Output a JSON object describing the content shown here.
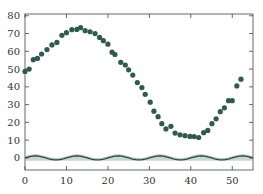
{
  "chart_data": {
    "type": "scatter",
    "title": "",
    "xlabel": "",
    "ylabel": "",
    "xlim": [
      0,
      55
    ],
    "ylim": [
      -6.8,
      81
    ],
    "grid": false,
    "legend": null,
    "x_ticks": [
      0,
      10,
      20,
      30,
      40,
      50
    ],
    "y_ticks": [
      0,
      10,
      20,
      30,
      40,
      50,
      60,
      70,
      80
    ],
    "series": [
      {
        "name": "observations",
        "type": "scatter",
        "color": "#2f5a4e",
        "points": [
          [
            0,
            48.7
          ],
          [
            1,
            50
          ],
          [
            2,
            55.3
          ],
          [
            3,
            56
          ],
          [
            4,
            58.5
          ],
          [
            5.3,
            61
          ],
          [
            6.5,
            63.6
          ],
          [
            7.7,
            65
          ],
          [
            8.9,
            69
          ],
          [
            10,
            70.5
          ],
          [
            11.3,
            72.2
          ],
          [
            12.5,
            72.3
          ],
          [
            13.4,
            73.3
          ],
          [
            14.5,
            71.6
          ],
          [
            15.7,
            71
          ],
          [
            16.9,
            70
          ],
          [
            18,
            67.8
          ],
          [
            18.9,
            66
          ],
          [
            20,
            64
          ],
          [
            21,
            59.5
          ],
          [
            21.7,
            58.2
          ],
          [
            23.1,
            53.8
          ],
          [
            24.2,
            52.3
          ],
          [
            25,
            49.6
          ],
          [
            26,
            46.6
          ],
          [
            27.1,
            42.4
          ],
          [
            28.2,
            39.6
          ],
          [
            29,
            35.8
          ],
          [
            30.2,
            31.4
          ],
          [
            31.1,
            26.3
          ],
          [
            32.1,
            23.2
          ],
          [
            33,
            19.3
          ],
          [
            34,
            16.3
          ],
          [
            35.2,
            17.8
          ],
          [
            36.2,
            14
          ],
          [
            37.4,
            13
          ],
          [
            38.6,
            12.5
          ],
          [
            39.8,
            12.1
          ],
          [
            40.8,
            12
          ],
          [
            41.9,
            11.5
          ],
          [
            43.1,
            14.2
          ],
          [
            44.1,
            15.5
          ],
          [
            45.1,
            19.3
          ],
          [
            46.1,
            22
          ],
          [
            47.1,
            26
          ],
          [
            48.1,
            28.2
          ],
          [
            49.1,
            32.2
          ],
          [
            50,
            32.2
          ],
          [
            51.1,
            40.5
          ],
          [
            52.1,
            44.3
          ]
        ]
      },
      {
        "name": "oscillation-dark",
        "type": "line",
        "color": "#2f4a44",
        "amplitude": 1.1,
        "period": 10,
        "phase_peak_x": 2.5,
        "offset": 0
      },
      {
        "name": "oscillation-light",
        "type": "area",
        "color": "#9fb8ad",
        "amplitude": 1.1,
        "period": 10,
        "phase_peak_x": 2.5,
        "offset": 0.6
      }
    ]
  },
  "axes": {
    "x_tick_labels": [
      "0",
      "10",
      "20",
      "30",
      "40",
      "50"
    ],
    "y_tick_labels": [
      "0",
      "10",
      "20",
      "30",
      "40",
      "50",
      "60",
      "70",
      "80"
    ]
  },
  "colors": {
    "points": "#2f5a4e",
    "wave_dark": "#2f4a44",
    "wave_light": "#9fb8ad",
    "axis": "#444444"
  }
}
